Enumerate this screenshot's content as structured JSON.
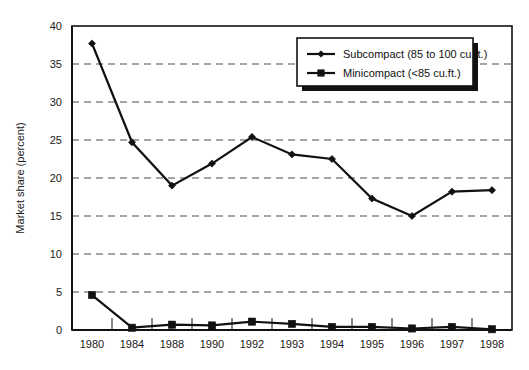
{
  "chart_data": {
    "type": "line",
    "title": "",
    "xlabel": "",
    "ylabel": "Market share (percent)",
    "ylim": [
      0,
      40
    ],
    "ytick_step": 5,
    "yticks": [
      "0",
      "5",
      "10",
      "15",
      "20",
      "25",
      "30",
      "35",
      "40"
    ],
    "grid": "horizontal-dashed",
    "legend_position": "top-right-inside",
    "categories": [
      "1980",
      "1984",
      "1988",
      "1990",
      "1992",
      "1993",
      "1994",
      "1995",
      "1996",
      "1997",
      "1998"
    ],
    "series": [
      {
        "name": "Subcompact (85 to 100 cu.ft.)",
        "marker": "diamond",
        "color": "#111111",
        "values": [
          37.7,
          24.7,
          19.0,
          21.9,
          25.4,
          23.1,
          22.5,
          17.3,
          15.0,
          18.2,
          18.4
        ]
      },
      {
        "name": "Minicompact (<85 cu.ft.)",
        "marker": "square",
        "color": "#111111",
        "values": [
          4.6,
          0.3,
          0.7,
          0.6,
          1.1,
          0.8,
          0.4,
          0.4,
          0.2,
          0.4,
          0.1
        ]
      }
    ]
  },
  "axis": {
    "y_title": "Market share (percent)"
  },
  "legend": {
    "entries": [
      {
        "label": "Subcompact (85 to 100 cu.ft.)",
        "marker": "diamond-marker-icon"
      },
      {
        "label": "Minicompact (<85 cu.ft.)",
        "marker": "square-marker-icon"
      }
    ]
  }
}
